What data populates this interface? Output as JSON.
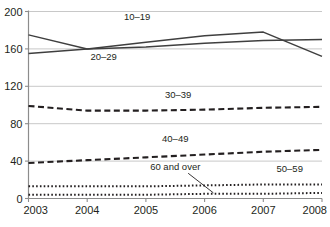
{
  "chart_data": {
    "type": "line",
    "title": "",
    "subtitle": "",
    "xlabel": "",
    "ylabel": "",
    "x": [
      2003,
      2004,
      2005,
      2006,
      2007,
      2008
    ],
    "xticklabels": [
      "2003",
      "2004",
      "2005",
      "2006",
      "2007",
      "2008"
    ],
    "xlim": [
      2003,
      2008
    ],
    "ylim": [
      0,
      200
    ],
    "yticks": [
      0,
      40,
      80,
      120,
      160,
      200
    ],
    "yticklabels": [
      "0",
      "40",
      "80",
      "120",
      "160",
      "200"
    ],
    "grid": "horizontal",
    "legend_position": "inline-labels",
    "series": [
      {
        "name": "10–19",
        "values": [
          175,
          160,
          167,
          174,
          178,
          152
        ],
        "style": "solid",
        "color": "#3f3f3f",
        "label": "10–19",
        "label_x": 2004.85,
        "label_y": 191
      },
      {
        "name": "20–29",
        "values": [
          155,
          160,
          162,
          166,
          169,
          170
        ],
        "style": "solid",
        "color": "#3f3f3f",
        "label": "20–29",
        "label_x": 2004.28,
        "label_y": 148
      },
      {
        "name": "30–39",
        "values": [
          99,
          94,
          94,
          95,
          97,
          98
        ],
        "style": "dashed",
        "color": "#231f20",
        "label": "30–39",
        "label_x": 2005.55,
        "label_y": 107
      },
      {
        "name": "40–49",
        "values": [
          38,
          41,
          44,
          47,
          50,
          52
        ],
        "style": "dashed",
        "color": "#231f20",
        "label": "40–49",
        "label_x": 2005.5,
        "label_y": 60
      },
      {
        "name": "50–59",
        "values": [
          13,
          13,
          13,
          14,
          15,
          15
        ],
        "style": "dotted",
        "color": "#231f20",
        "label": "50–59",
        "label_x": 2007.45,
        "label_y": 28
      },
      {
        "name": "60 and over",
        "values": [
          4,
          4,
          4,
          5,
          5,
          6
        ],
        "style": "dotted",
        "color": "#231f20",
        "label": "60 and over",
        "label_x": 2005.5,
        "label_y": 31,
        "annotation": {
          "text": "60 and over",
          "leader_from_x": 2005.72,
          "leader_from_y": 27,
          "leader_to_x": 2006.15,
          "leader_to_y": 6
        }
      }
    ]
  },
  "axes": {
    "y_axis_name": "y-axis",
    "x_axis_name": "x-axis"
  },
  "caption": {
    "text": ""
  },
  "colors": {
    "line_solid": "#3f3f3f",
    "line_dark": "#231f20",
    "grid": "#c8c8c8",
    "axis": "#8c8c8c",
    "text": "#231f20",
    "background": "#ffffff"
  }
}
